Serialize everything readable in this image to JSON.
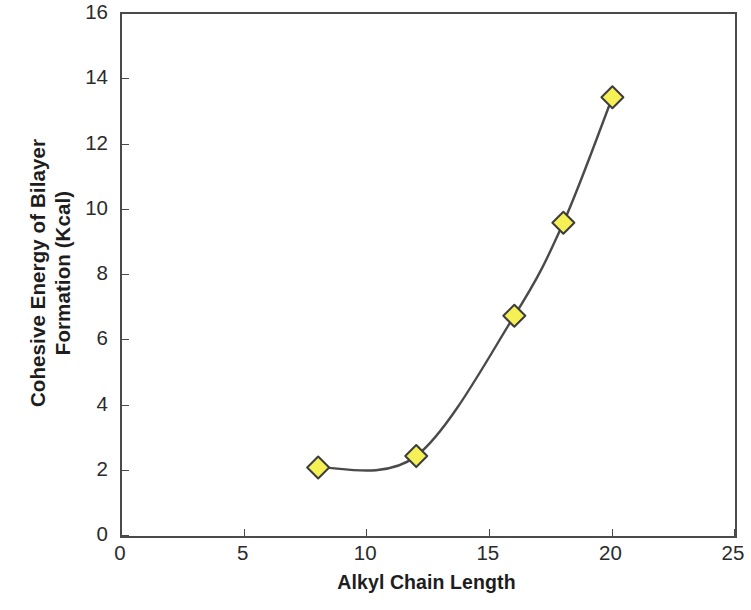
{
  "chart_data": {
    "type": "line",
    "title": "",
    "xlabel": "Alkyl Chain Length",
    "ylabel": "Cohesive Energy of Bilayer Formation (Kcal)",
    "ylabel_lines": [
      "Cohesive Energy of Bilayer",
      "Formation (Kcal)"
    ],
    "x": [
      8,
      12,
      16,
      18,
      20
    ],
    "values": [
      2.1,
      2.45,
      6.75,
      9.6,
      13.45
    ],
    "series": [
      {
        "name": "Cohesive Energy of Bilayer Formation",
        "x": [
          8,
          12,
          16,
          18,
          20
        ],
        "values": [
          2.1,
          2.45,
          6.75,
          9.6,
          13.45
        ]
      }
    ],
    "xlim": [
      0,
      25
    ],
    "ylim": [
      0,
      16
    ],
    "xticks": [
      0,
      5,
      10,
      15,
      20,
      25
    ],
    "yticks": [
      0,
      2,
      4,
      6,
      8,
      10,
      12,
      14,
      16
    ],
    "xtick_labels": [
      "0",
      "5",
      "10",
      "15",
      "20",
      "25"
    ],
    "ytick_labels": [
      "0",
      "2",
      "4",
      "6",
      "8",
      "10",
      "12",
      "14",
      "16"
    ],
    "grid": false,
    "legend": null,
    "legend_position": "none",
    "marker": "diamond",
    "marker_fill_color": "#F5F055",
    "marker_edge_color": "#3d3d3d",
    "line_color": "#4a4a4a",
    "line_style": "smooth",
    "axis_color": "#4a4a4a",
    "background_color": "#ffffff",
    "annotations": []
  }
}
